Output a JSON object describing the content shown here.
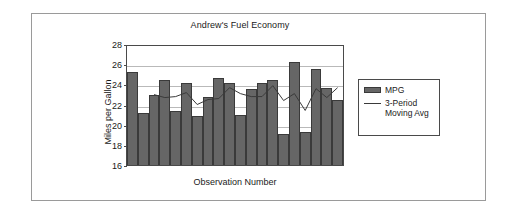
{
  "chart_data": {
    "type": "bar",
    "title": "Andrew's Fuel Economy",
    "xlabel": "Observation Number",
    "ylabel": "Miles per Gallon",
    "ylim": [
      16,
      28
    ],
    "yticks": [
      28,
      26,
      24,
      22,
      20,
      18,
      16
    ],
    "grid": true,
    "legend_position": "right",
    "categories": [
      "1",
      "2",
      "3",
      "4",
      "5",
      "6",
      "7",
      "8",
      "9",
      "10",
      "11",
      "12",
      "13",
      "14",
      "15",
      "16",
      "17",
      "18",
      "19",
      "20"
    ],
    "series": [
      {
        "name": "MPG",
        "type": "bar",
        "color": "#666666",
        "values": [
          25.2,
          21.2,
          22.9,
          24.4,
          21.4,
          24.1,
          20.9,
          22.7,
          24.6,
          24.1,
          21.0,
          23.5,
          24.1,
          24.4,
          19.1,
          26.2,
          19.3,
          25.5,
          23.6,
          22.4
        ]
      },
      {
        "name": "3-Period Moving Avg",
        "type": "line",
        "color": "#3a3a3a",
        "values": [
          null,
          null,
          23.1,
          22.8,
          22.9,
          23.3,
          22.1,
          22.6,
          22.7,
          23.8,
          23.2,
          22.9,
          22.9,
          24.0,
          22.5,
          23.2,
          21.5,
          23.7,
          22.8,
          23.8
        ]
      }
    ],
    "legend": [
      {
        "label": "MPG",
        "key": "swatch",
        "color": "#666666"
      },
      {
        "label": "3-Period Moving Avg",
        "key": "line",
        "color": "#3a3a3a"
      }
    ]
  }
}
